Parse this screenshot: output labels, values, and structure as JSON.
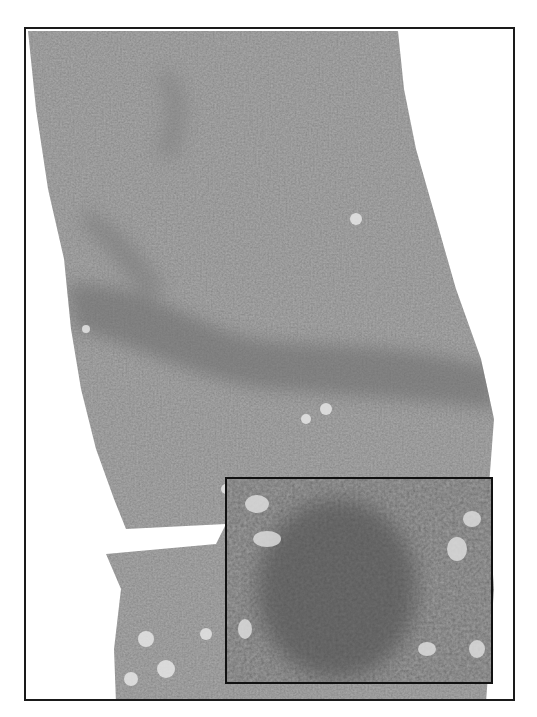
{
  "figure": {
    "type": "histology-micrograph",
    "colors": {
      "frame_border": "#1a1a1a",
      "inset_border": "#111111",
      "tissue_light": "#b4b4b4",
      "tissue_mid": "#9a9a9a",
      "band_dark": "#828282",
      "background": "#ffffff"
    },
    "panels": [
      {
        "id": "main",
        "description": "low-magnification tissue section with a dark diagonal band across the middle"
      },
      {
        "id": "inset",
        "description": "high-magnification view of the dense cellular band",
        "position": "bottom-right"
      }
    ]
  }
}
